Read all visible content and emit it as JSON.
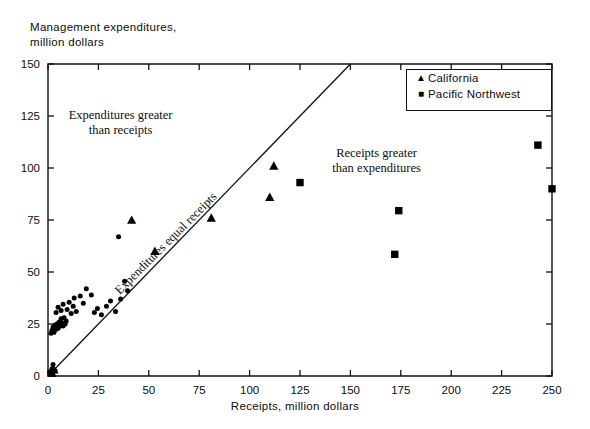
{
  "chart_data": {
    "type": "scatter",
    "title": "",
    "xlabel": "Receipts, million dollars",
    "ylabel": "Management expenditures,\nmillion dollars",
    "xlim": [
      0,
      250
    ],
    "ylim": [
      0,
      150
    ],
    "xticks": [
      0,
      25,
      50,
      75,
      100,
      125,
      150,
      175,
      200,
      225,
      250
    ],
    "yticks": [
      0,
      25,
      50,
      75,
      100,
      125,
      150
    ],
    "grid": false,
    "legend_position": "top-right",
    "annotations": [
      {
        "name": "expenditures-greater-annotation",
        "text": "Expenditures greater\nthan receipts",
        "x": 36,
        "y": 121,
        "rotation": 0
      },
      {
        "name": "receipts-greater-annotation",
        "text": "Receipts greater\nthan expenditures",
        "x": 163,
        "y": 103,
        "rotation": 0
      },
      {
        "name": "equal-line-annotation",
        "text": "Expenditures equal receipts",
        "x": 66,
        "y": 60,
        "rotation": -45
      }
    ],
    "reference_line": {
      "name": "equal-line",
      "label": "Expenditures equal receipts",
      "from": [
        0,
        0
      ],
      "to": [
        150,
        150
      ]
    },
    "series": [
      {
        "name": "California",
        "marker": "triangle",
        "color": "#000000",
        "points": [
          [
            2.0,
            1.5
          ],
          [
            3.0,
            3.0
          ],
          [
            41.5,
            75.0
          ],
          [
            53.0,
            60.0
          ],
          [
            81.0,
            76.0
          ],
          [
            110.0,
            86.0
          ],
          [
            112.0,
            101.0
          ]
        ]
      },
      {
        "name": "Pacific Northwest",
        "marker": "square",
        "color": "#000000",
        "points": [
          [
            125.0,
            93.0
          ],
          [
            172.0,
            58.5
          ],
          [
            174.0,
            79.5
          ],
          [
            243.0,
            111.0
          ],
          [
            250.0,
            90.0
          ]
        ]
      },
      {
        "name": "Other regions",
        "marker": "circle",
        "color": "#000000",
        "points": [
          [
            1.0,
            2.0
          ],
          [
            2.0,
            3.5
          ],
          [
            2.5,
            5.5
          ],
          [
            3.5,
            2.5
          ],
          [
            1.5,
            20.5
          ],
          [
            2.0,
            22.0
          ],
          [
            2.5,
            23.5
          ],
          [
            3.0,
            21.0
          ],
          [
            3.5,
            24.5
          ],
          [
            4.0,
            22.5
          ],
          [
            4.5,
            25.0
          ],
          [
            5.0,
            23.0
          ],
          [
            5.5,
            26.0
          ],
          [
            6.0,
            24.0
          ],
          [
            6.5,
            27.5
          ],
          [
            7.0,
            25.5
          ],
          [
            7.5,
            24.0
          ],
          [
            8.0,
            28.0
          ],
          [
            8.5,
            25.0
          ],
          [
            9.0,
            26.5
          ],
          [
            4.0,
            30.5
          ],
          [
            5.0,
            33.0
          ],
          [
            6.5,
            31.5
          ],
          [
            7.5,
            34.5
          ],
          [
            9.5,
            32.0
          ],
          [
            10.5,
            35.5
          ],
          [
            11.5,
            30.0
          ],
          [
            12.5,
            33.5
          ],
          [
            13.0,
            37.5
          ],
          [
            14.0,
            31.0
          ],
          [
            16.0,
            38.5
          ],
          [
            17.5,
            35.0
          ],
          [
            19.0,
            42.0
          ],
          [
            21.5,
            39.0
          ],
          [
            23.0,
            30.5
          ],
          [
            24.5,
            32.5
          ],
          [
            26.5,
            29.5
          ],
          [
            29.0,
            33.5
          ],
          [
            31.0,
            36.0
          ],
          [
            33.5,
            31.0
          ],
          [
            36.0,
            37.0
          ],
          [
            38.0,
            45.5
          ],
          [
            39.5,
            41.0
          ],
          [
            35.0,
            67.0
          ]
        ]
      }
    ]
  },
  "legend": {
    "items": [
      {
        "marker": "triangle",
        "label": "California"
      },
      {
        "marker": "square",
        "label": "Pacific Northwest"
      }
    ]
  }
}
